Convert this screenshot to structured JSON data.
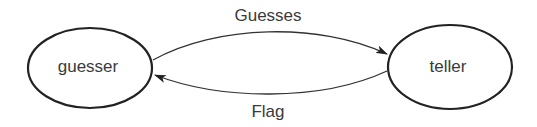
{
  "diagram": {
    "type": "state-diagram",
    "nodes": [
      {
        "id": "guesser",
        "label": "guesser"
      },
      {
        "id": "teller",
        "label": "teller"
      }
    ],
    "edges": [
      {
        "from": "guesser",
        "to": "teller",
        "label": "Guesses"
      },
      {
        "from": "teller",
        "to": "guesser",
        "label": "Flag"
      }
    ],
    "colors": {
      "stroke": "#222222",
      "text": "#3a3a3a",
      "background": "#ffffff"
    }
  }
}
